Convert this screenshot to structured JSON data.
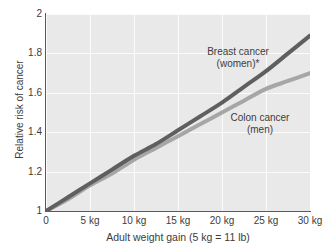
{
  "chart_data": {
    "type": "line",
    "title": "",
    "xlabel": "Adult weight gain (5 kg = 11 lb)",
    "ylabel": "Relative risk of cancer",
    "xlim": [
      0,
      30
    ],
    "ylim": [
      1,
      2
    ],
    "grid": true,
    "legend_position": "inline-annotations",
    "x_tick_labels": [
      "0",
      "5 kg",
      "10 kg",
      "15 kg",
      "20 kg",
      "25 kg",
      "30 kg"
    ],
    "x_tick_values": [
      0,
      5,
      10,
      15,
      20,
      25,
      30
    ],
    "y_tick_labels": [
      "2",
      "1.8",
      "1.6",
      "1.4",
      "1.2",
      "1"
    ],
    "y_tick_values": [
      2,
      1.8,
      1.6,
      1.4,
      1.2,
      1
    ],
    "x": [
      0,
      2.5,
      5,
      7.5,
      10,
      12.5,
      15,
      17.5,
      20,
      22.5,
      25,
      27.5,
      30
    ],
    "series": [
      {
        "name": "Breast cancer (women)*",
        "label_line1": "Breast cancer",
        "label_line2": "(women)*",
        "color": "#5f5f5f",
        "values": [
          1.0,
          1.07,
          1.14,
          1.21,
          1.28,
          1.34,
          1.41,
          1.48,
          1.55,
          1.63,
          1.71,
          1.8,
          1.89
        ]
      },
      {
        "name": "Colon cancer (men)",
        "label_line1": "Colon cancer",
        "label_line2": "(men)",
        "color": "#a6a6a6",
        "values": [
          1.0,
          1.06,
          1.13,
          1.19,
          1.26,
          1.32,
          1.38,
          1.44,
          1.5,
          1.56,
          1.62,
          1.66,
          1.7
        ]
      }
    ],
    "annotations": [
      {
        "text": "Breast cancer (women)*"
      },
      {
        "text": "Colon cancer (men)"
      }
    ],
    "colors": {
      "plot_background": "#e9e9e9",
      "gridline": "#fbfbfb",
      "axis": "#5a5a5a",
      "text": "#3c3c3c",
      "page_background": "#ffffff"
    }
  }
}
